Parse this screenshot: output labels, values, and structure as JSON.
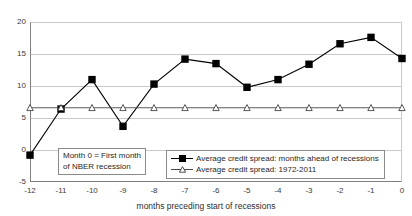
{
  "chart_data": {
    "type": "line",
    "title": "",
    "xlabel": "months preceding start of recessions",
    "ylabel": "",
    "x": [
      -12,
      -11,
      -10,
      -9,
      -8,
      -7,
      -6,
      -5,
      -4,
      -3,
      -2,
      -1,
      0
    ],
    "xtick_labels": [
      "-12",
      "-11",
      "-10",
      "-9",
      "-8",
      "-7",
      "-6",
      "-5",
      "-4",
      "-3",
      "-2",
      "-1",
      "0"
    ],
    "ytick_labels": [
      "20",
      "15",
      "10",
      "5",
      "0",
      "-5"
    ],
    "yticks": [
      20,
      15,
      10,
      5,
      0,
      -5
    ],
    "ylim": [
      -5,
      20
    ],
    "xlim": [
      -12,
      0
    ],
    "grid": true,
    "legend_position": "bottom-right",
    "series": [
      {
        "name": "Average credit spread: months ahead of recessions",
        "marker": "filled-square",
        "color": "#000000",
        "values": [
          -0.8,
          6.4,
          11.0,
          3.7,
          10.3,
          14.2,
          13.5,
          9.8,
          11.0,
          13.4,
          16.6,
          17.6,
          14.3
        ]
      },
      {
        "name": "Average credit spread: 1972-2011",
        "marker": "open-triangle",
        "color": "#4a4a4a",
        "values": [
          6.6,
          6.6,
          6.6,
          6.6,
          6.6,
          6.6,
          6.6,
          6.6,
          6.6,
          6.6,
          6.6,
          6.6,
          6.6
        ]
      }
    ],
    "annotations": [
      {
        "name": "month-zero-note",
        "line1": "Month 0 = First month",
        "line2": "of NBER recession"
      }
    ]
  },
  "legend": {
    "entries": [
      "Average credit spread: months ahead of recessions",
      "Average credit spread: 1972-2011"
    ]
  },
  "annotation": {
    "line1": "Month 0 = First month",
    "line2": "of NBER recession"
  },
  "axis": {
    "x_title": "months preceding start of recessions"
  }
}
